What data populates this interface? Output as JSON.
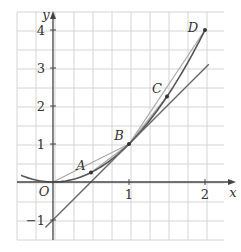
{
  "figure": {
    "axes": {
      "x_label": "x",
      "y_label": "y",
      "origin_label": "O",
      "x_ticks": [
        {
          "value": 1,
          "label": "1"
        },
        {
          "value": 2,
          "label": "2"
        }
      ],
      "y_ticks": [
        {
          "value": -1,
          "label": "-1"
        },
        {
          "value": 1,
          "label": "1"
        },
        {
          "value": 2,
          "label": "2"
        },
        {
          "value": 3,
          "label": "3"
        },
        {
          "value": 4,
          "label": "4"
        }
      ],
      "x_range": [
        -0.45,
        2.2
      ],
      "y_range": [
        -1.5,
        4.5
      ]
    },
    "curve": {
      "equation": "y = x^2",
      "x_from": -0.42,
      "x_to": 2.0
    },
    "points": [
      {
        "label": "A",
        "x": 0.5,
        "y": 0.25
      },
      {
        "label": "B",
        "x": 1,
        "y": 1
      },
      {
        "label": "C",
        "x": 1.5,
        "y": 2.25
      },
      {
        "label": "D",
        "x": 2,
        "y": 4
      }
    ],
    "tangent": {
      "label": "tangent at B",
      "equation": "y = 2x - 1",
      "x_from": -0.1,
      "x_to": 2.05
    },
    "secants": [
      {
        "from": "A",
        "to": "B"
      },
      {
        "from": "B",
        "to": "C"
      },
      {
        "from": "B",
        "to": "D"
      },
      {
        "from": "O",
        "to": "B"
      }
    ],
    "colors": {
      "grid": "#d4d4d4",
      "axis": "#444444",
      "curve": "#555555",
      "tangent": "#666666",
      "secant": "#aaaaaa"
    }
  }
}
